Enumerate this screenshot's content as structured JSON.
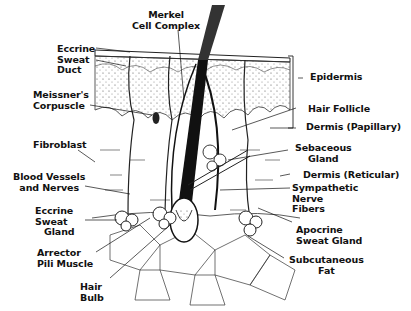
{
  "diagram": {
    "labels": {
      "merkel_cell_complex": [
        "Merkel",
        "Cell Complex"
      ],
      "eccrine_sweat_duct": [
        "Eccrine",
        "Sweat",
        "Duct"
      ],
      "meissners_corpuscle": [
        "Meissner's",
        "Corpuscle"
      ],
      "fibroblast": [
        "Fibroblast"
      ],
      "blood_vessels_and_nerves": [
        "Blood Vessels",
        "and Nerves"
      ],
      "eccrine_sweat_gland": [
        "Eccrine",
        "Sweat",
        "Gland"
      ],
      "arrector_pili_muscle": [
        "Arrector",
        "Pili Muscle"
      ],
      "hair_bulb": [
        "Hair",
        "Bulb"
      ],
      "epidermis": [
        "Epidermis"
      ],
      "hair_follicle": [
        "Hair Follicle"
      ],
      "dermis_papillary": [
        "Dermis (Papillary)"
      ],
      "sebaceous_gland": [
        "Sebaceous",
        "Gland"
      ],
      "dermis_reticular": [
        "Dermis (Reticular)"
      ],
      "sympathetic_nerve_fibers": [
        "Sympathetic",
        "Nerve",
        "Fibers"
      ],
      "apocrine_sweat_gland": [
        "Apocrine",
        "Sweat Gland"
      ],
      "subcutaneous_fat": [
        "Subcutaneous",
        "Fat"
      ]
    },
    "colors": {
      "ink": "#111111",
      "background": "#ffffff"
    }
  }
}
